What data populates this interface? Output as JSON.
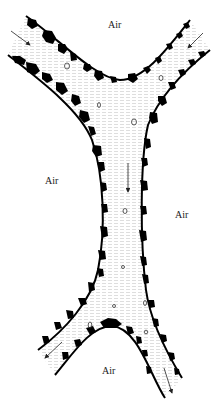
{
  "diagram": {
    "labels": [
      {
        "id": "air-top",
        "text": "Air",
        "x": 108,
        "y": 20
      },
      {
        "id": "air-left",
        "text": "Air",
        "x": 45,
        "y": 176
      },
      {
        "id": "air-right",
        "text": "Air",
        "x": 175,
        "y": 210
      },
      {
        "id": "air-bottom",
        "text": "Air",
        "x": 102,
        "y": 366
      }
    ],
    "arrows": [
      {
        "id": "arrow-upper-left",
        "direction": "inflow",
        "from": [
          11,
          31
        ],
        "to": [
          30,
          45
        ]
      },
      {
        "id": "arrow-upper-right",
        "direction": "inflow",
        "from": [
          203,
          33
        ],
        "to": [
          188,
          48
        ]
      },
      {
        "id": "arrow-center",
        "direction": "downward",
        "from": [
          128,
          163
        ],
        "to": [
          128,
          192
        ]
      },
      {
        "id": "arrow-lower-left",
        "direction": "outflow",
        "from": [
          62,
          342
        ],
        "to": [
          45,
          358
        ]
      },
      {
        "id": "arrow-lower-right",
        "direction": "outflow",
        "from": [
          164,
          368
        ],
        "to": [
          172,
          393
        ]
      }
    ],
    "colors": {
      "particles": "#000000",
      "liquid_hatch": "#c8c8c8",
      "background": "#ffffff"
    }
  }
}
